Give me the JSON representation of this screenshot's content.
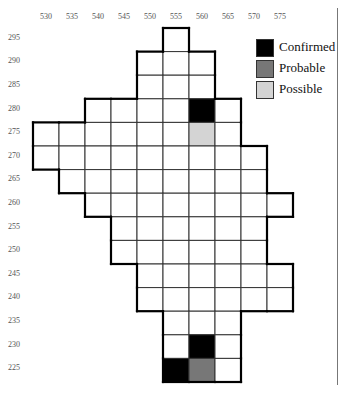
{
  "x_axis": {
    "labels": [
      "530",
      "535",
      "540",
      "545",
      "550",
      "555",
      "560",
      "565",
      "570",
      "575"
    ]
  },
  "y_axis": {
    "labels": [
      "295",
      "290",
      "285",
      "280",
      "275",
      "270",
      "265",
      "260",
      "255",
      "250",
      "245",
      "240",
      "235",
      "230",
      "225"
    ]
  },
  "legend": {
    "items": [
      {
        "label": "Confirmed",
        "color": "#000000"
      },
      {
        "label": "Probable",
        "color": "#777777"
      },
      {
        "label": "Possible",
        "color": "#d4d4d4"
      }
    ]
  },
  "grid": {
    "origin_x": 33,
    "origin_y": 28,
    "cell_w": 26,
    "cell_h": 23.6,
    "rows": [
      {
        "y": 295,
        "from": 555,
        "to": 555
      },
      {
        "y": 290,
        "from": 550,
        "to": 560
      },
      {
        "y": 285,
        "from": 550,
        "to": 560
      },
      {
        "y": 280,
        "from": 540,
        "to": 565
      },
      {
        "y": 275,
        "from": 530,
        "to": 565
      },
      {
        "y": 270,
        "from": 530,
        "to": 570
      },
      {
        "y": 265,
        "from": 535,
        "to": 570
      },
      {
        "y": 260,
        "from": 540,
        "to": 575
      },
      {
        "y": 255,
        "from": 545,
        "to": 570
      },
      {
        "y": 250,
        "from": 545,
        "to": 570
      },
      {
        "y": 245,
        "from": 550,
        "to": 575
      },
      {
        "y": 240,
        "from": 550,
        "to": 575
      },
      {
        "y": 235,
        "from": 555,
        "to": 565
      },
      {
        "y": 230,
        "from": 555,
        "to": 565
      },
      {
        "y": 225,
        "from": 555,
        "to": 565
      }
    ],
    "filled": [
      {
        "x": 560,
        "y": 280,
        "status": "Confirmed"
      },
      {
        "x": 560,
        "y": 275,
        "status": "Possible"
      },
      {
        "x": 560,
        "y": 230,
        "status": "Confirmed"
      },
      {
        "x": 555,
        "y": 225,
        "status": "Confirmed"
      },
      {
        "x": 560,
        "y": 225,
        "status": "Probable"
      }
    ]
  }
}
